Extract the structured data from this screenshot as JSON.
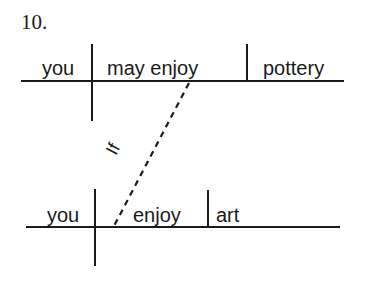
{
  "problem": {
    "number": "10."
  },
  "main_clause": {
    "subject": "you",
    "verb": "may enjoy",
    "object": "pottery"
  },
  "subordinate_clause": {
    "subject": "you",
    "verb": "enjoy",
    "object": "art"
  },
  "connector": {
    "conjunction": "If",
    "style": "dashed"
  },
  "colors": {
    "ink": "#1a1a1a",
    "background": "#ffffff"
  }
}
